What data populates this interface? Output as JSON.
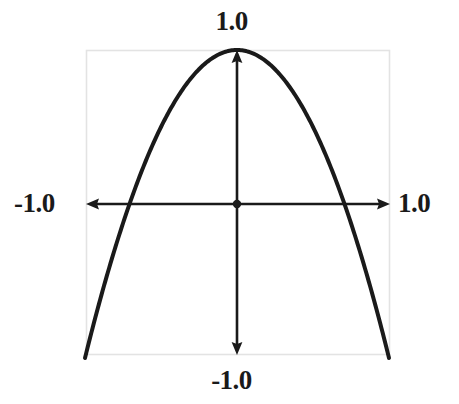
{
  "figure": {
    "background_color": "#ffffff",
    "frame_color": "#e3e3e3",
    "ink_color": "#1a1a1a"
  },
  "labels": {
    "top": "1.0",
    "bottom": "-1.0",
    "left": "-1.0",
    "right": "1.0"
  },
  "chart_data": {
    "type": "line",
    "title": "",
    "xlabel": "",
    "ylabel": "",
    "xlim": [
      -1.0,
      1.0
    ],
    "ylim": [
      -1.0,
      1.0
    ],
    "grid": false,
    "legend": null,
    "axes_style": "arrows-through-origin",
    "origin_marker": true,
    "tick_labels": {
      "x": [
        "-1.0",
        "1.0"
      ],
      "y": [
        "-1.0",
        "1.0"
      ]
    },
    "series": [
      {
        "name": "parabola",
        "equation": "y = 1 - 2x^2",
        "color": "#1a1a1a",
        "linewidth": 4,
        "x": [
          -1.0,
          -0.9,
          -0.8,
          -0.707,
          -0.6,
          -0.5,
          -0.4,
          -0.3,
          -0.2,
          -0.1,
          0.0,
          0.1,
          0.2,
          0.3,
          0.4,
          0.5,
          0.6,
          0.707,
          0.8,
          0.9,
          1.0
        ],
        "y": [
          -1.0,
          -0.62,
          -0.28,
          0.0,
          0.28,
          0.5,
          0.68,
          0.82,
          0.92,
          0.98,
          1.0,
          0.98,
          0.92,
          0.82,
          0.68,
          0.5,
          0.28,
          0.0,
          -0.28,
          -0.62,
          -1.0
        ]
      }
    ],
    "annotations": [
      {
        "name": "vertex",
        "x": 0.0,
        "y": 1.0
      },
      {
        "name": "root-left",
        "x": -0.707,
        "y": 0.0
      },
      {
        "name": "root-right",
        "x": 0.707,
        "y": 0.0
      }
    ]
  }
}
